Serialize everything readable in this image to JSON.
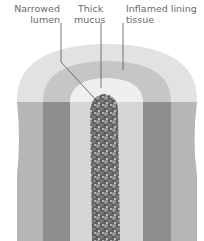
{
  "labels": {
    "narrowed_lumen": [
      "Narrowed",
      "lumen"
    ],
    "thick_mucus": [
      "Thick",
      "mucus"
    ],
    "inflamed_lining": [
      "Inflamed lining",
      "tissue"
    ]
  },
  "colors": {
    "outer_wall_top": "#e4e4e4",
    "outer_wall_bottom": "#b4b4b4",
    "lining_top": "#c8c8c8",
    "lining_bottom": "#8c8c8c",
    "mucus_top": "#f0f0f0",
    "mucus_bottom": "#d8d8d8",
    "lumen": "#6e6e6e",
    "leader_line": "#555555",
    "label_text": "#6a6a6a"
  }
}
